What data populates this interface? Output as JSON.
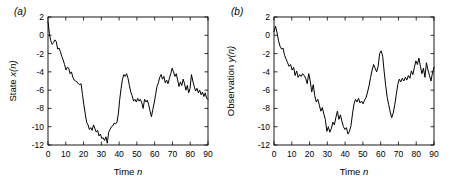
{
  "figure": {
    "background_color": "#ffffff",
    "line_color": "#000000",
    "axis_color": "#000000"
  },
  "panels": [
    {
      "id": "a",
      "label": "(a)",
      "chart_data": {
        "type": "line",
        "title": "",
        "xlabel": "Time n",
        "ylabel": "State x(n)",
        "xlim": [
          0,
          90
        ],
        "ylim": [
          -12,
          2
        ],
        "xticks": [
          0,
          10,
          20,
          30,
          40,
          50,
          60,
          70,
          80,
          90
        ],
        "yticks": [
          2,
          0,
          -2,
          -4,
          -6,
          -8,
          -10,
          -12
        ],
        "grid": false,
        "legend": "none",
        "x": [
          0,
          1,
          2,
          3,
          4,
          5,
          6,
          7,
          8,
          9,
          10,
          11,
          12,
          13,
          14,
          15,
          16,
          17,
          18,
          19,
          20,
          21,
          22,
          23,
          24,
          25,
          26,
          27,
          28,
          29,
          30,
          31,
          32,
          33,
          34,
          35,
          36,
          37,
          38,
          39,
          40,
          41,
          42,
          43,
          44,
          45,
          46,
          47,
          48,
          49,
          50,
          51,
          52,
          53,
          54,
          55,
          56,
          57,
          58,
          59,
          60,
          61,
          62,
          63,
          64,
          65,
          66,
          67,
          68,
          69,
          70,
          71,
          72,
          73,
          74,
          75,
          76,
          77,
          78,
          79,
          80,
          81,
          82,
          83,
          84,
          85,
          86,
          87,
          88,
          89,
          90
        ],
        "values": [
          1.5,
          0.2,
          -0.6,
          -1.0,
          -0.8,
          -0.5,
          -0.7,
          -1.5,
          -1.4,
          -1.8,
          -2.3,
          -2.7,
          -3.2,
          -3.8,
          -3.5,
          -3.6,
          -4.2,
          -4.0,
          -4.6,
          -4.9,
          -5.0,
          -5.1,
          -5.3,
          -5.4,
          -5.3,
          -6.5,
          -7.6,
          -8.6,
          -9.5,
          -9.8,
          -10.3,
          -10.1,
          -10.4,
          -9.8,
          -10.2,
          -10.6,
          -10.4,
          -11.0,
          -10.8,
          -11.3,
          -11.2,
          -11.5,
          -11.1,
          -11.8,
          -10.6,
          -10.3,
          -10.0,
          -9.9,
          -9.6,
          -9.7,
          -9.5,
          -8.6,
          -7.0,
          -5.8,
          -4.8,
          -4.3,
          -4.5,
          -4.2,
          -4.7,
          -5.5,
          -6.2,
          -6.6,
          -7.2,
          -7.0,
          -7.3,
          -6.9,
          -7.2,
          -7.0,
          -7.4,
          -8.0,
          -7.0,
          -7.3,
          -7.1,
          -7.6,
          -8.3,
          -8.9,
          -8.1,
          -7.4,
          -6.5,
          -5.6,
          -5.2,
          -4.6,
          -4.3,
          -4.8,
          -4.5,
          -5.2,
          -4.9,
          -5.3,
          -4.7,
          -4.2,
          -3.6,
          -4.0,
          -4.5,
          -4.2,
          -4.9,
          -5.6,
          -5.1,
          -5.5,
          -4.8,
          -5.3,
          -6.0,
          -5.5,
          -6.3,
          -5.8,
          -4.3,
          -5.0,
          -5.6,
          -6.1,
          -5.8,
          -6.3,
          -6.0,
          -6.5,
          -6.2,
          -6.7,
          -6.3,
          -6.9,
          -7.0
        ]
      }
    },
    {
      "id": "b",
      "label": "(b)",
      "chart_data": {
        "type": "line",
        "title": "",
        "xlabel": "Time n",
        "ylabel": "Observation y(n)",
        "xlim": [
          0,
          90
        ],
        "ylim": [
          -12,
          2
        ],
        "xticks": [
          0,
          10,
          20,
          30,
          40,
          50,
          60,
          70,
          80,
          90
        ],
        "yticks": [
          2,
          0,
          -2,
          -4,
          -6,
          -8,
          -10,
          -12
        ],
        "grid": false,
        "legend": "none",
        "x": [
          0,
          1,
          2,
          3,
          4,
          5,
          6,
          7,
          8,
          9,
          10,
          11,
          12,
          13,
          14,
          15,
          16,
          17,
          18,
          19,
          20,
          21,
          22,
          23,
          24,
          25,
          26,
          27,
          28,
          29,
          30,
          31,
          32,
          33,
          34,
          35,
          36,
          37,
          38,
          39,
          40,
          41,
          42,
          43,
          44,
          45,
          46,
          47,
          48,
          49,
          50,
          51,
          52,
          53,
          54,
          55,
          56,
          57,
          58,
          59,
          60,
          61,
          62,
          63,
          64,
          65,
          66,
          67,
          68,
          69,
          70,
          71,
          72,
          73,
          74,
          75,
          76,
          77,
          78,
          79,
          80,
          81,
          82,
          83,
          84,
          85,
          86,
          87,
          88,
          89,
          90
        ],
        "values": [
          0.4,
          1.0,
          0.3,
          -0.6,
          -1.2,
          -1.5,
          -1.4,
          -2.2,
          -2.6,
          -3.0,
          -3.4,
          -3.2,
          -3.8,
          -3.5,
          -4.4,
          -3.9,
          -4.6,
          -4.3,
          -4.5,
          -4.2,
          -4.4,
          -4.7,
          -5.3,
          -4.2,
          -5.0,
          -6.2,
          -5.4,
          -6.6,
          -7.3,
          -7.0,
          -7.6,
          -8.3,
          -7.9,
          -8.6,
          -9.2,
          -10.5,
          -10.0,
          -10.6,
          -10.2,
          -9.5,
          -9.8,
          -9.0,
          -8.3,
          -9.2,
          -8.7,
          -9.4,
          -10.0,
          -10.3,
          -10.1,
          -10.8,
          -10.5,
          -9.9,
          -8.6,
          -7.5,
          -7.0,
          -7.3,
          -6.9,
          -7.4,
          -7.2,
          -7.5,
          -7.1,
          -6.8,
          -6.2,
          -5.5,
          -4.6,
          -3.8,
          -3.2,
          -3.6,
          -4.0,
          -3.4,
          -2.0,
          -1.7,
          -2.3,
          -4.0,
          -5.5,
          -6.8,
          -7.6,
          -8.4,
          -9.0,
          -8.5,
          -7.6,
          -6.5,
          -5.4,
          -4.8,
          -5.1,
          -4.7,
          -5.0,
          -4.6,
          -4.9,
          -4.4,
          -4.7,
          -3.9,
          -4.3,
          -3.5,
          -2.8,
          -3.2,
          -2.5,
          -3.4,
          -4.2,
          -3.6,
          -4.6,
          -3.0,
          -3.8,
          -4.4,
          -5.0,
          -4.1,
          -3.5
        ]
      }
    }
  ]
}
